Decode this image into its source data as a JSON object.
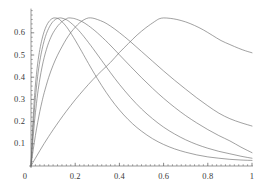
{
  "chart_data": {
    "type": "line",
    "title": "",
    "subtitle": "",
    "xlabel": "",
    "ylabel": "",
    "xlim": [
      0,
      1
    ],
    "ylim": [
      0,
      0.7
    ],
    "grid": false,
    "legend": "none",
    "axis_color": "#555555",
    "curve_color": "#6e6e6e",
    "background": "#ffffff",
    "x_ticks": [
      {
        "value": 0,
        "label": "0"
      },
      {
        "value": 0.2,
        "label": "0.2"
      },
      {
        "value": 0.4,
        "label": "0.4"
      },
      {
        "value": 0.6,
        "label": "0.6"
      },
      {
        "value": 0.8,
        "label": "0.8"
      },
      {
        "value": 1.0,
        "label": "1"
      }
    ],
    "y_ticks": [
      {
        "value": 0.1,
        "label": "0.1"
      },
      {
        "value": 0.2,
        "label": "0.2"
      },
      {
        "value": 0.3,
        "label": "0.3"
      },
      {
        "value": 0.4,
        "label": "0.4"
      },
      {
        "value": 0.5,
        "label": "0.5"
      },
      {
        "value": 0.6,
        "label": "0.6"
      }
    ],
    "x_minor_tick_step": 0.02,
    "y_minor_tick_step": 0.02,
    "peak_value": 0.67,
    "series": [
      {
        "name": "curve-1",
        "peak_x": 0.11,
        "end_value": 0.025,
        "points": [
          [
            0.0,
            0.0
          ],
          [
            0.005,
            0.12
          ],
          [
            0.01,
            0.22
          ],
          [
            0.015,
            0.3
          ],
          [
            0.02,
            0.365
          ],
          [
            0.03,
            0.46
          ],
          [
            0.04,
            0.525
          ],
          [
            0.05,
            0.572
          ],
          [
            0.06,
            0.607
          ],
          [
            0.07,
            0.632
          ],
          [
            0.08,
            0.649
          ],
          [
            0.09,
            0.66
          ],
          [
            0.1,
            0.666
          ],
          [
            0.11,
            0.667
          ],
          [
            0.12,
            0.665
          ],
          [
            0.13,
            0.659
          ],
          [
            0.15,
            0.64
          ],
          [
            0.17,
            0.614
          ],
          [
            0.2,
            0.567
          ],
          [
            0.23,
            0.515
          ],
          [
            0.26,
            0.462
          ],
          [
            0.3,
            0.394
          ],
          [
            0.34,
            0.332
          ],
          [
            0.38,
            0.277
          ],
          [
            0.42,
            0.23
          ],
          [
            0.46,
            0.19
          ],
          [
            0.5,
            0.157
          ],
          [
            0.55,
            0.123
          ],
          [
            0.6,
            0.097
          ],
          [
            0.65,
            0.077
          ],
          [
            0.7,
            0.062
          ],
          [
            0.75,
            0.05
          ],
          [
            0.8,
            0.041
          ],
          [
            0.85,
            0.035
          ],
          [
            0.9,
            0.03
          ],
          [
            0.95,
            0.027
          ],
          [
            1.0,
            0.025
          ]
        ]
      },
      {
        "name": "curve-2",
        "peak_x": 0.13,
        "end_value": 0.035,
        "points": [
          [
            0.0,
            0.0
          ],
          [
            0.005,
            0.095
          ],
          [
            0.01,
            0.178
          ],
          [
            0.015,
            0.248
          ],
          [
            0.02,
            0.308
          ],
          [
            0.03,
            0.404
          ],
          [
            0.04,
            0.473
          ],
          [
            0.05,
            0.525
          ],
          [
            0.06,
            0.566
          ],
          [
            0.07,
            0.597
          ],
          [
            0.08,
            0.62
          ],
          [
            0.09,
            0.638
          ],
          [
            0.1,
            0.651
          ],
          [
            0.11,
            0.66
          ],
          [
            0.12,
            0.665
          ],
          [
            0.13,
            0.667
          ],
          [
            0.14,
            0.666
          ],
          [
            0.16,
            0.659
          ],
          [
            0.18,
            0.645
          ],
          [
            0.21,
            0.617
          ],
          [
            0.24,
            0.582
          ],
          [
            0.28,
            0.53
          ],
          [
            0.32,
            0.475
          ],
          [
            0.36,
            0.42
          ],
          [
            0.4,
            0.368
          ],
          [
            0.45,
            0.309
          ],
          [
            0.5,
            0.257
          ],
          [
            0.55,
            0.213
          ],
          [
            0.6,
            0.175
          ],
          [
            0.65,
            0.144
          ],
          [
            0.7,
            0.118
          ],
          [
            0.75,
            0.097
          ],
          [
            0.8,
            0.08
          ],
          [
            0.85,
            0.066
          ],
          [
            0.9,
            0.055
          ],
          [
            0.95,
            0.044
          ],
          [
            1.0,
            0.035
          ]
        ]
      },
      {
        "name": "curve-3",
        "peak_x": 0.17,
        "end_value": 0.06,
        "points": [
          [
            0.0,
            0.0
          ],
          [
            0.005,
            0.07
          ],
          [
            0.01,
            0.133
          ],
          [
            0.015,
            0.19
          ],
          [
            0.02,
            0.24
          ],
          [
            0.03,
            0.325
          ],
          [
            0.04,
            0.392
          ],
          [
            0.05,
            0.446
          ],
          [
            0.06,
            0.49
          ],
          [
            0.07,
            0.526
          ],
          [
            0.08,
            0.556
          ],
          [
            0.09,
            0.58
          ],
          [
            0.1,
            0.6
          ],
          [
            0.115,
            0.623
          ],
          [
            0.13,
            0.641
          ],
          [
            0.145,
            0.654
          ],
          [
            0.16,
            0.663
          ],
          [
            0.17,
            0.667
          ],
          [
            0.185,
            0.666
          ],
          [
            0.2,
            0.663
          ],
          [
            0.23,
            0.651
          ],
          [
            0.26,
            0.632
          ],
          [
            0.3,
            0.6
          ],
          [
            0.35,
            0.553
          ],
          [
            0.4,
            0.501
          ],
          [
            0.45,
            0.449
          ],
          [
            0.5,
            0.398
          ],
          [
            0.55,
            0.35
          ],
          [
            0.6,
            0.305
          ],
          [
            0.65,
            0.264
          ],
          [
            0.7,
            0.227
          ],
          [
            0.75,
            0.194
          ],
          [
            0.8,
            0.164
          ],
          [
            0.85,
            0.137
          ],
          [
            0.9,
            0.113
          ],
          [
            0.95,
            0.085
          ],
          [
            1.0,
            0.06
          ]
        ]
      },
      {
        "name": "curve-4",
        "peak_x": 0.26,
        "end_value": 0.18,
        "points": [
          [
            0.0,
            0.0
          ],
          [
            0.01,
            0.073
          ],
          [
            0.02,
            0.138
          ],
          [
            0.03,
            0.195
          ],
          [
            0.04,
            0.246
          ],
          [
            0.05,
            0.291
          ],
          [
            0.06,
            0.331
          ],
          [
            0.08,
            0.399
          ],
          [
            0.1,
            0.454
          ],
          [
            0.12,
            0.499
          ],
          [
            0.14,
            0.537
          ],
          [
            0.16,
            0.572
          ],
          [
            0.18,
            0.601
          ],
          [
            0.2,
            0.625
          ],
          [
            0.22,
            0.645
          ],
          [
            0.24,
            0.659
          ],
          [
            0.26,
            0.667
          ],
          [
            0.28,
            0.666
          ],
          [
            0.3,
            0.66
          ],
          [
            0.33,
            0.648
          ],
          [
            0.36,
            0.63
          ],
          [
            0.4,
            0.601
          ],
          [
            0.45,
            0.56
          ],
          [
            0.5,
            0.516
          ],
          [
            0.55,
            0.472
          ],
          [
            0.6,
            0.428
          ],
          [
            0.65,
            0.386
          ],
          [
            0.7,
            0.346
          ],
          [
            0.75,
            0.307
          ],
          [
            0.8,
            0.271
          ],
          [
            0.85,
            0.238
          ],
          [
            0.9,
            0.213
          ],
          [
            0.95,
            0.195
          ],
          [
            1.0,
            0.18
          ]
        ]
      },
      {
        "name": "curve-5",
        "peak_x": 0.58,
        "end_value": 0.51,
        "points": [
          [
            0.0,
            0.0
          ],
          [
            0.02,
            0.035
          ],
          [
            0.04,
            0.069
          ],
          [
            0.06,
            0.102
          ],
          [
            0.08,
            0.133
          ],
          [
            0.1,
            0.163
          ],
          [
            0.13,
            0.206
          ],
          [
            0.16,
            0.247
          ],
          [
            0.2,
            0.298
          ],
          [
            0.24,
            0.345
          ],
          [
            0.28,
            0.389
          ],
          [
            0.32,
            0.429
          ],
          [
            0.36,
            0.467
          ],
          [
            0.4,
            0.511
          ],
          [
            0.44,
            0.551
          ],
          [
            0.48,
            0.59
          ],
          [
            0.52,
            0.623
          ],
          [
            0.56,
            0.651
          ],
          [
            0.58,
            0.663
          ],
          [
            0.6,
            0.667
          ],
          [
            0.63,
            0.665
          ],
          [
            0.66,
            0.66
          ],
          [
            0.7,
            0.649
          ],
          [
            0.74,
            0.633
          ],
          [
            0.78,
            0.613
          ],
          [
            0.82,
            0.589
          ],
          [
            0.86,
            0.565
          ],
          [
            0.9,
            0.547
          ],
          [
            0.94,
            0.53
          ],
          [
            0.97,
            0.519
          ],
          [
            1.0,
            0.51
          ]
        ]
      }
    ]
  },
  "geometry": {
    "origin_x_px": 31,
    "origin_y_px": 166,
    "x_span_px": 221,
    "y_unit_px": 222
  }
}
